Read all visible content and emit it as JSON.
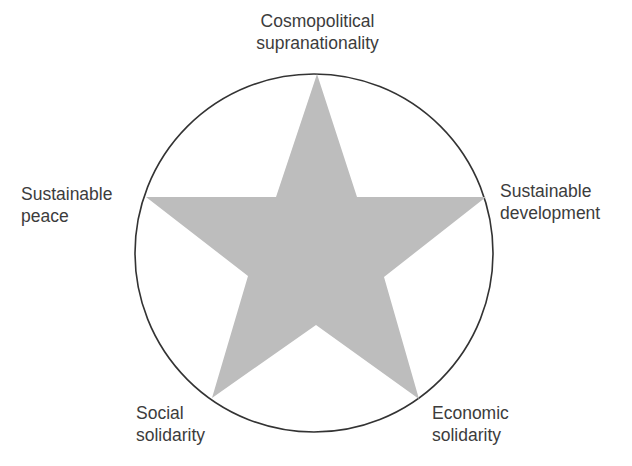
{
  "diagram": {
    "type": "star-in-circle",
    "colors": {
      "star_fill": "#bdbdbd",
      "circle_stroke": "#333333",
      "background": "#ffffff",
      "text": "#3c3c3c"
    },
    "labels": {
      "top": {
        "line1": "Cosmopolitical",
        "line2": "supranationality"
      },
      "left": {
        "line1": "Sustainable",
        "line2": "peace"
      },
      "right": {
        "line1": "Sustainable",
        "line2": "development"
      },
      "bottom_left": {
        "line1": "Social",
        "line2": "solidarity"
      },
      "bottom_right": {
        "line1": "Economic",
        "line2": "solidarity"
      }
    }
  }
}
